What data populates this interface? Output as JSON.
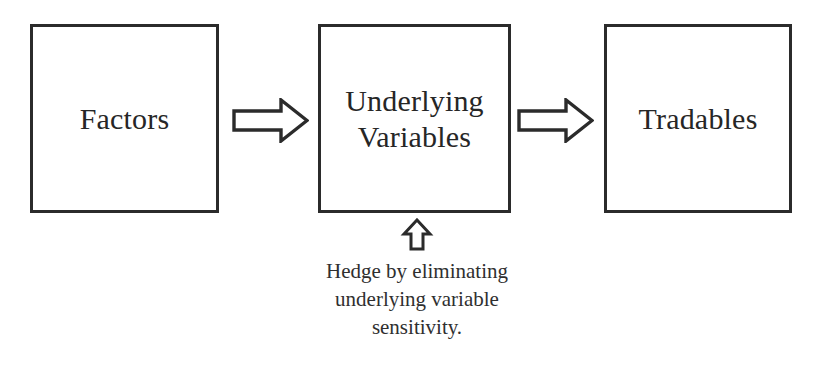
{
  "diagram": {
    "background_color": "#ffffff",
    "line_color": "#2b2b2b",
    "text_color": "#262626",
    "nodes": [
      {
        "id": "factors",
        "label": "Factors"
      },
      {
        "id": "underlying",
        "label": "Underlying\nVariables"
      },
      {
        "id": "tradables",
        "label": "Tradables"
      }
    ],
    "connectors": [
      {
        "id": "factors-to-underlying",
        "icon": "block-arrow-right-icon",
        "direction": "right",
        "from": "factors",
        "to": "underlying"
      },
      {
        "id": "underlying-to-tradables",
        "icon": "block-arrow-right-icon",
        "direction": "right",
        "from": "underlying",
        "to": "tradables"
      },
      {
        "id": "hedge-to-underlying",
        "icon": "block-arrow-up-icon",
        "direction": "up",
        "from": "hedge-caption",
        "to": "underlying"
      }
    ],
    "annotation": {
      "id": "hedge-caption",
      "lines": [
        "Hedge by eliminating",
        "underlying variable",
        "sensitivity."
      ]
    }
  }
}
